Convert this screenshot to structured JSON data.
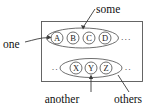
{
  "diagram": {
    "type": "set-membership-diagram",
    "container": {
      "name": "outer-rectangle",
      "x": 41,
      "y": 21,
      "width": 102,
      "height": 61
    },
    "groups": [
      {
        "id": "some",
        "label": "some",
        "ellipse": {
          "cx": 82.5,
          "cy": 38,
          "rx": 36,
          "ry": 10
        },
        "members": [
          {
            "letter": "A",
            "cx": 57,
            "cy": 38,
            "r": 6
          },
          {
            "letter": "B",
            "cx": 73,
            "cy": 38,
            "r": 6
          },
          {
            "letter": "C",
            "cx": 89,
            "cy": 38,
            "r": 6
          },
          {
            "letter": "D",
            "cx": 105,
            "cy": 38,
            "r": 6
          }
        ],
        "trailing_ellipsis": "···",
        "leading_ellipsis": ""
      },
      {
        "id": "others",
        "label": "others",
        "ellipse": {
          "cx": 91,
          "cy": 68,
          "rx": 31,
          "ry": 9.5
        },
        "members": [
          {
            "letter": "X",
            "cx": 76,
            "cy": 68,
            "r": 6
          },
          {
            "letter": "Y",
            "cx": 91,
            "cy": 68,
            "r": 6
          },
          {
            "letter": "Z",
            "cx": 106,
            "cy": 68,
            "r": 6
          }
        ],
        "trailing_ellipsis": "··",
        "leading_ellipsis": "··"
      }
    ],
    "labels": [
      {
        "id": "some",
        "text": "some",
        "x": 96,
        "y": 13,
        "anchor": "start"
      },
      {
        "id": "one",
        "text": "one",
        "x": 3,
        "y": 44,
        "anchor": "start"
      },
      {
        "id": "another",
        "text": "another",
        "x": 62,
        "y": 101,
        "anchor": "middle"
      },
      {
        "id": "others",
        "text": "others",
        "x": 126,
        "y": 101,
        "anchor": "middle"
      }
    ],
    "colors": {
      "background": "#ffffff",
      "stroke": "#4a4a4a",
      "box_stroke": "#555555",
      "text": "#111111",
      "node_fill": "#ffffff"
    }
  }
}
